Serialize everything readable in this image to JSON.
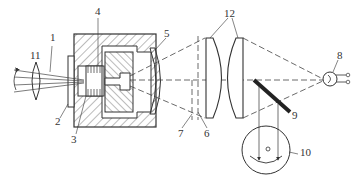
{
  "diagram": {
    "type": "optical-mechanical schematic",
    "colors": {
      "line": "#333333",
      "hatch": "#555555",
      "background": "#ffffff"
    },
    "labels": [
      {
        "id": "1",
        "text": "1",
        "x": 50,
        "y": 38
      },
      {
        "id": "2",
        "text": "2",
        "x": 55,
        "y": 120
      },
      {
        "id": "3",
        "text": "3",
        "x": 71,
        "y": 136
      },
      {
        "id": "4",
        "text": "4",
        "x": 95,
        "y": 8
      },
      {
        "id": "5",
        "text": "5",
        "x": 164,
        "y": 30
      },
      {
        "id": "6",
        "text": "6",
        "x": 205,
        "y": 130
      },
      {
        "id": "7",
        "text": "7",
        "x": 180,
        "y": 130
      },
      {
        "id": "8",
        "text": "8",
        "x": 337,
        "y": 53
      },
      {
        "id": "9",
        "text": "9",
        "x": 292,
        "y": 112
      },
      {
        "id": "10",
        "text": "10",
        "x": 300,
        "y": 148
      },
      {
        "id": "11",
        "text": "11",
        "x": 30,
        "y": 51
      },
      {
        "id": "12",
        "text": "12",
        "x": 225,
        "y": 9
      }
    ]
  }
}
